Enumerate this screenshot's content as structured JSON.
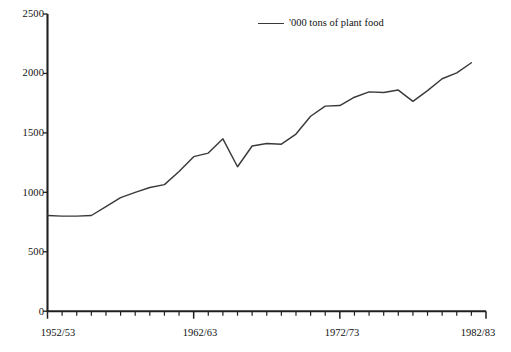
{
  "figure": {
    "background_color": "#ffffff",
    "ink_color": "#1f1f1f",
    "series_color": "#3a3a3a"
  },
  "legend": {
    "label": "'000 tons of plant food",
    "swatch_name": "line-swatch",
    "position": "top-center"
  },
  "axes": {
    "y_ticks": [
      "0",
      "500",
      "1000",
      "1500",
      "2000",
      "2500"
    ],
    "x_ticks": [
      "1952/53",
      "1962/63",
      "1972/73",
      "1982/83"
    ],
    "x_tick_years": [
      1952,
      1962,
      1972,
      1982
    ],
    "grid": "none"
  },
  "caption": {
    "text": ""
  },
  "chart_data": {
    "type": "line",
    "title": "",
    "subtitle": "",
    "xlabel": "",
    "ylabel": "",
    "xlim": [
      1952,
      1982
    ],
    "ylim": [
      0,
      2500
    ],
    "grid": false,
    "legend_position": "top-center",
    "x_tick_labels": [
      "1952/53",
      "1962/63",
      "1972/73",
      "1982/83"
    ],
    "x_tick_values": [
      1952,
      1962,
      1972,
      1982
    ],
    "y_tick_values": [
      0,
      500,
      1000,
      1500,
      2000,
      2500
    ],
    "series": [
      {
        "name": "'000 tons of plant food",
        "color": "#3a3a3a",
        "x": [
          1952,
          1953,
          1954,
          1955,
          1956,
          1957,
          1958,
          1959,
          1960,
          1961,
          1962,
          1963,
          1964,
          1965,
          1966,
          1967,
          1968,
          1969,
          1970,
          1971,
          1972,
          1973,
          1974,
          1975,
          1976,
          1977,
          1978,
          1979,
          1980,
          1981
        ],
        "x_labels": [
          "1952/53",
          "1953/54",
          "1954/55",
          "1955/56",
          "1956/57",
          "1957/58",
          "1958/59",
          "1959/60",
          "1960/61",
          "1961/62",
          "1962/63",
          "1963/64",
          "1964/65",
          "1965/66",
          "1966/67",
          "1967/68",
          "1968/69",
          "1969/70",
          "1970/71",
          "1971/72",
          "1972/73",
          "1973/74",
          "1974/75",
          "1975/76",
          "1976/77",
          "1977/78",
          "1978/79",
          "1979/80",
          "1980/81",
          "1981/82"
        ],
        "values": [
          805,
          800,
          800,
          805,
          880,
          955,
          1000,
          1040,
          1065,
          1175,
          1300,
          1330,
          1450,
          1215,
          1390,
          1410,
          1405,
          1490,
          1640,
          1725,
          1730,
          1800,
          1845,
          1840,
          1860,
          1765,
          1855,
          1955,
          2005,
          2090
        ]
      }
    ]
  }
}
